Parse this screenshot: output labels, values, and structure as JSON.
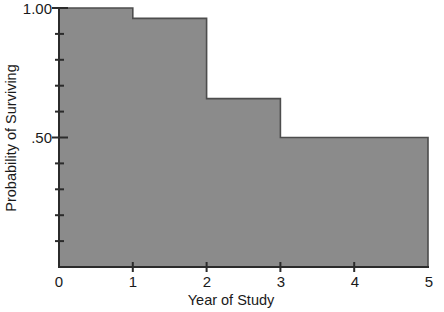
{
  "chart_data": {
    "type": "area",
    "title": "",
    "subtitle": "",
    "xlabel": "Year of Study",
    "ylabel": "Probability of Surviving",
    "xlim": [
      0,
      5
    ],
    "ylim": [
      0,
      1.0
    ],
    "grid": false,
    "legend": null,
    "step_style": "post",
    "fill_color": "#8b8b8b",
    "line_color": "#4d4d4d",
    "background_color": "#ffffff",
    "x": [
      0,
      1,
      2,
      3,
      5
    ],
    "values": [
      1.0,
      0.96,
      0.65,
      0.5,
      0.5
    ],
    "series": [
      {
        "name": "Survival probability",
        "steps": [
          {
            "x_start": 0,
            "x_end": 1,
            "y": 1.0
          },
          {
            "x_start": 1,
            "x_end": 2,
            "y": 0.96
          },
          {
            "x_start": 2,
            "x_end": 3,
            "y": 0.65
          },
          {
            "x_start": 3,
            "x_end": 5,
            "y": 0.5
          }
        ]
      }
    ],
    "x_ticks": [
      {
        "value": 0,
        "label": "0"
      },
      {
        "value": 1,
        "label": "1"
      },
      {
        "value": 2,
        "label": "2"
      },
      {
        "value": 3,
        "label": "3"
      },
      {
        "value": 4,
        "label": "4"
      },
      {
        "value": 5,
        "label": "5"
      }
    ],
    "y_ticks_major": [
      {
        "value": 1.0,
        "label": "1.00"
      },
      {
        "value": 0.5,
        "label": ".50"
      }
    ],
    "y_ticks_minor": [
      0.9,
      0.8,
      0.7,
      0.6,
      0.4,
      0.3,
      0.2,
      0.1
    ],
    "annotations": []
  },
  "axes": {
    "x_title": "Year of Study",
    "y_title": "Probability of Surviving"
  },
  "xtick_labels": {
    "t0": "0",
    "t1": "1",
    "t2": "2",
    "t3": "3",
    "t4": "4",
    "t5": "5"
  },
  "ytick_labels": {
    "top": "1.00",
    "mid": ".50"
  }
}
